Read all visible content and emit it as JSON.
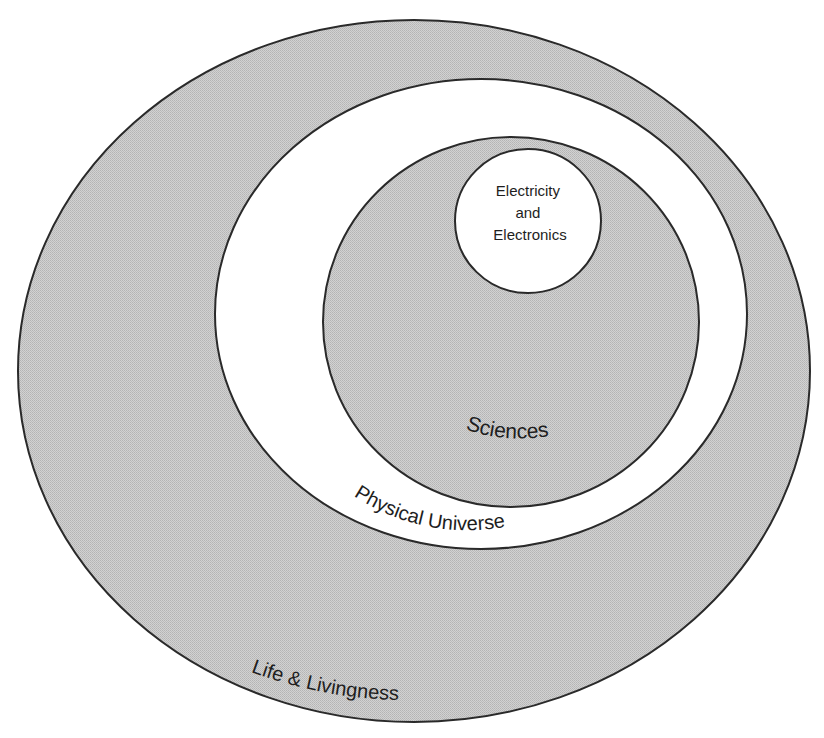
{
  "diagram": {
    "type": "nested-ellipses",
    "colors": {
      "background": "#ffffff",
      "shaded_fill": "#c8c8c8",
      "white_fill": "#ffffff",
      "stroke": "#2a2a2a",
      "text": "#1e1e1e"
    },
    "regions": [
      {
        "id": "life-and-livingness",
        "label": "Life & Livingness",
        "fill": "shaded",
        "level": 1
      },
      {
        "id": "physical-universe",
        "label": "Physical Universe",
        "fill": "white",
        "level": 2
      },
      {
        "id": "sciences",
        "label": "Sciences",
        "fill": "shaded",
        "level": 3
      },
      {
        "id": "electricity-and-electronics",
        "label_lines": [
          "Electricity",
          "and",
          "Electronics"
        ],
        "fill": "white",
        "level": 4
      }
    ]
  }
}
